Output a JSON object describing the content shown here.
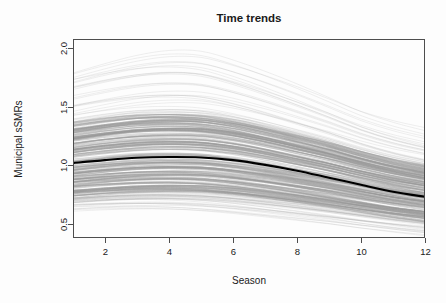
{
  "chart_data": {
    "type": "line",
    "title": "Time trends",
    "xlabel": "Season",
    "ylabel": "Municipal sSMRs",
    "xlim": [
      1,
      12
    ],
    "ylim": [
      0.38,
      2.08
    ],
    "xticks": [
      2,
      4,
      6,
      8,
      10,
      12
    ],
    "xticklabels": [
      "2",
      "4",
      "6",
      "8",
      "10",
      "12"
    ],
    "yticks": [
      0.5,
      1.0,
      1.5,
      2.0
    ],
    "yticklabels": [
      "0.5",
      "1.0",
      "1.5",
      "2.0"
    ],
    "grid": false,
    "legend": null,
    "x": [
      1,
      2,
      3,
      4,
      5,
      6,
      7,
      8,
      9,
      10,
      11,
      12
    ],
    "series": [
      {
        "name": "Overall median trend",
        "role": "median",
        "color": "#000000",
        "width": 2.1,
        "values": [
          1.02,
          1.045,
          1.065,
          1.072,
          1.068,
          1.045,
          1.005,
          0.955,
          0.895,
          0.835,
          0.775,
          0.732
        ]
      },
      {
        "name": "Municipality sSMR curves",
        "role": "spaghetti",
        "color": "#999999",
        "width": 0.5,
        "count": 260,
        "description": "260 faint grey municipality-specific smoothed sSMR curves overplotted to form a dense band",
        "envelope_upper": [
          1.84,
          1.92,
          1.99,
          2.03,
          2.02,
          1.94,
          1.84,
          1.73,
          1.61,
          1.49,
          1.4,
          1.33
        ],
        "envelope_lower": [
          0.585,
          0.595,
          0.6,
          0.598,
          0.585,
          0.565,
          0.54,
          0.515,
          0.49,
          0.46,
          0.435,
          0.412
        ],
        "dense_band_upper": [
          1.36,
          1.4,
          1.43,
          1.44,
          1.43,
          1.39,
          1.33,
          1.26,
          1.19,
          1.11,
          1.04,
          0.985
        ],
        "dense_band_lower": [
          0.735,
          0.755,
          0.77,
          0.775,
          0.77,
          0.75,
          0.722,
          0.69,
          0.655,
          0.618,
          0.582,
          0.552
        ]
      }
    ]
  },
  "style": {
    "background": "#fdfdfd",
    "axis_color": "#4d4d4d",
    "text_color": "#1a1a1a",
    "spaghetti_color": "#999999",
    "median_color": "#000000"
  },
  "geometry": {
    "plot_left": 73,
    "plot_right": 425,
    "plot_top": 39,
    "plot_bottom": 238
  }
}
